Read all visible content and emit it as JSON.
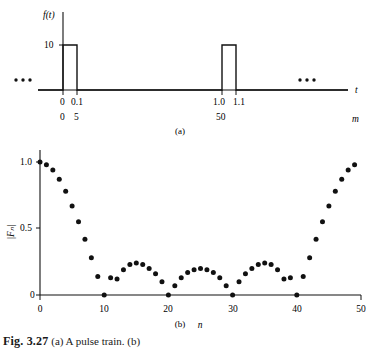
{
  "figure": {
    "caption_prefix": "Fig. 3.27",
    "caption_rest": "(a) A pulse train. (b)"
  },
  "panel_a": {
    "label": "(a)",
    "y_axis_label": "f(t)",
    "y_tick_label": "10",
    "x_axis_label_t": "t",
    "x_axis_label_m": "m",
    "t_ticks": [
      "0",
      "0.1",
      "1.0",
      "1.1"
    ],
    "m_ticks": [
      "0",
      "5",
      "50"
    ],
    "left_ellipsis": "•••",
    "right_ellipsis": "•••",
    "amplitude": 10,
    "pulse_width": 0.1,
    "period": 1.0
  },
  "panel_b": {
    "label": "(b)",
    "y_axis_label": "|Fₙ|",
    "x_axis_label": "n",
    "y_ticks": [
      "0",
      "0.5",
      "1.0"
    ],
    "x_ticks": [
      "0",
      "10",
      "20",
      "30",
      "40",
      "50"
    ]
  },
  "chart_data": [
    {
      "type": "line",
      "title": "(a) Pulse train f(t)",
      "xlabel": "t",
      "ylabel": "f(t)",
      "secondary_xlabel": "m",
      "xlim": [
        -0.25,
        1.45
      ],
      "ylim": [
        0,
        12
      ],
      "grid": false,
      "legend": null,
      "annotations": [
        "••• left",
        "••• right"
      ],
      "x_tick_values": [
        0,
        0.1,
        1.0,
        1.1
      ],
      "x_tick_labels": [
        "0",
        "0.1",
        "1.0",
        "1.1"
      ],
      "secondary_x_tick_values": [
        0,
        5,
        50
      ],
      "secondary_x_tick_labels": [
        "0",
        "5",
        "50"
      ],
      "y_tick_values": [
        10
      ],
      "y_tick_labels": [
        "10"
      ],
      "x": [
        -0.25,
        0,
        0,
        0.1,
        0.1,
        1.0,
        1.0,
        1.1,
        1.1,
        1.45
      ],
      "values": [
        0,
        0,
        10,
        10,
        0,
        0,
        10,
        10,
        0,
        0
      ]
    },
    {
      "type": "scatter",
      "title": "(b) Magnitude spectrum |Fn|",
      "xlabel": "n",
      "ylabel": "|Fn|",
      "xlim": [
        0,
        50
      ],
      "ylim": [
        0,
        1.05
      ],
      "grid": false,
      "legend": null,
      "x": [
        0,
        1,
        2,
        3,
        4,
        5,
        6,
        7,
        8,
        9,
        10,
        11,
        12,
        13,
        14,
        15,
        16,
        17,
        18,
        19,
        20,
        21,
        22,
        23,
        24,
        25,
        26,
        27,
        28,
        29,
        30,
        31,
        32,
        33,
        34,
        35,
        36,
        37,
        38,
        39,
        40,
        41,
        42,
        43,
        44,
        45,
        46,
        47,
        48,
        49
      ],
      "values": [
        1.0,
        0.98,
        0.94,
        0.87,
        0.78,
        0.67,
        0.55,
        0.42,
        0.28,
        0.14,
        0.0,
        0.13,
        0.12,
        0.19,
        0.23,
        0.24,
        0.23,
        0.2,
        0.16,
        0.1,
        0.0,
        0.07,
        0.13,
        0.17,
        0.19,
        0.2,
        0.19,
        0.17,
        0.13,
        0.07,
        0.0,
        0.1,
        0.16,
        0.2,
        0.23,
        0.24,
        0.23,
        0.19,
        0.12,
        0.13,
        0.0,
        0.14,
        0.28,
        0.42,
        0.55,
        0.67,
        0.78,
        0.87,
        0.94,
        0.98
      ]
    }
  ]
}
